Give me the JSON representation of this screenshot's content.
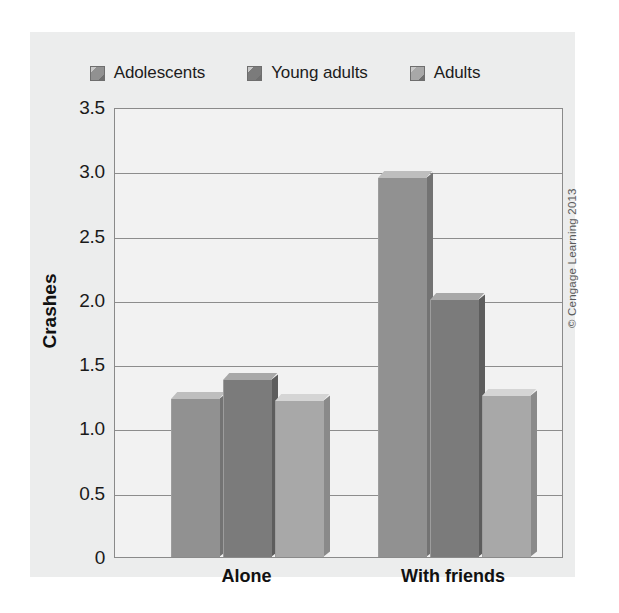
{
  "figure": {
    "credit": "© Cengage Learning 2013"
  },
  "legend": {
    "items": [
      {
        "label": "Adolescents",
        "color": "#919191"
      },
      {
        "label": "Young adults",
        "color": "#7b7b7b"
      },
      {
        "label": "Adults",
        "color": "#a8a8a8"
      }
    ]
  },
  "axes": {
    "y_title": "Crashes",
    "y_ticks": [
      "3.5",
      "3.0",
      "2.5",
      "2.0",
      "1.5",
      "1.0",
      "0.5",
      "0"
    ],
    "x_ticks": [
      "Alone",
      "With friends"
    ]
  },
  "chart_data": {
    "type": "bar",
    "title": "",
    "subtitle": "",
    "xlabel": "",
    "ylabel": "Crashes",
    "categories": [
      "Alone",
      "With friends"
    ],
    "series": [
      {
        "name": "Adolescents",
        "values": [
          1.23,
          2.95
        ],
        "color": "#919191"
      },
      {
        "name": "Young adults",
        "values": [
          1.38,
          2.0
        ],
        "color": "#7b7b7b"
      },
      {
        "name": "Adults",
        "values": [
          1.21,
          1.25
        ],
        "color": "#a8a8a8"
      }
    ],
    "ylim": [
      0,
      3.5
    ],
    "ytick_values": [
      0,
      0.5,
      1.0,
      1.5,
      2.0,
      2.5,
      3.0,
      3.5
    ],
    "grid": true,
    "legend_position": "top"
  }
}
